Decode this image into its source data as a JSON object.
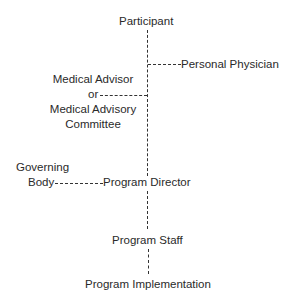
{
  "diagram": {
    "type": "organizational-flow",
    "nodes": {
      "participant": "Participant",
      "personal_physician": "Personal Physician",
      "medical_advisor_line1": "Medical Advisor",
      "medical_advisor_line2": "or",
      "medical_advisor_line3": "Medical Advisory",
      "medical_advisor_line4": "Committee",
      "governing_body_line1": "Governing",
      "governing_body_line2": "Body",
      "program_director": "Program Director",
      "program_staff": "Program Staff",
      "program_implementation": "Program Implementation"
    },
    "edges": [
      {
        "from": "Participant",
        "to": "Personal Physician",
        "style": "dashed"
      },
      {
        "from": "Participant",
        "to": "Medical Advisor or Medical Advisory Committee",
        "style": "dashed"
      },
      {
        "from": "Participant",
        "to": "Program Director",
        "style": "dashed"
      },
      {
        "from": "Governing Body",
        "to": "Program Director",
        "style": "dashed"
      },
      {
        "from": "Program Director",
        "to": "Program Staff",
        "style": "dashed"
      },
      {
        "from": "Program Staff",
        "to": "Program Implementation",
        "style": "dashed"
      }
    ]
  }
}
